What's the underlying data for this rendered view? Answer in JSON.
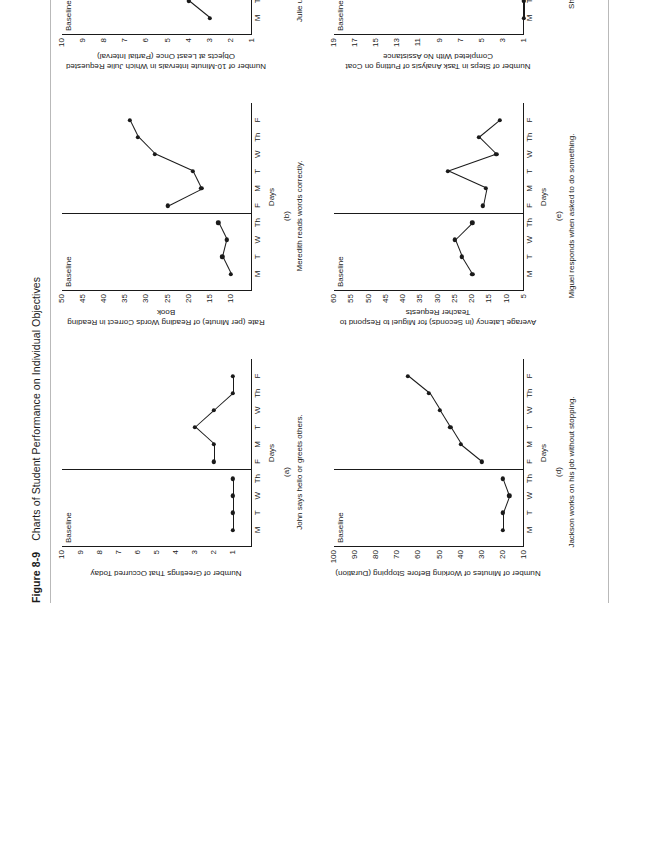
{
  "figure": {
    "number": "Figure 8-9",
    "title": "Charts of Student Performance on Individual Objectives",
    "folio": "193"
  },
  "common": {
    "baseline_label": "Baseline",
    "xaxis_title": "Days",
    "day_labels": [
      "M",
      "T",
      "W",
      "Th",
      "F",
      "M",
      "T",
      "W",
      "Th",
      "F"
    ]
  },
  "chart_data": [
    {
      "id": "a",
      "type": "line",
      "title": "Number of Greetings\nThat Occurred Today",
      "ylabel": "Number of Greetings That Occurred Today",
      "xlabel": "Days",
      "caption_letter": "(a)",
      "caption": "John says hello or greets others.",
      "phase_label": "Baseline",
      "phase_break_after": 3,
      "ylim": [
        0,
        10
      ],
      "yticks": [
        1,
        2,
        3,
        4,
        5,
        6,
        7,
        8,
        9,
        10
      ],
      "categories": [
        "M",
        "T",
        "W",
        "Th",
        "F",
        "M",
        "T",
        "W",
        "Th",
        "F"
      ],
      "values": [
        1,
        1,
        1,
        1,
        2,
        2,
        3,
        2,
        1,
        1
      ]
    },
    {
      "id": "b",
      "type": "line",
      "title": "Rate (per Minute) of Reading\nWords Correct in Reading Book",
      "ylabel": "Rate (per Minute) of Reading Words Correct in Reading Book",
      "xlabel": "Days",
      "caption_letter": "(b)",
      "caption": "Meredith reads words correctly.",
      "phase_label": "Baseline",
      "phase_break_after": 3,
      "ylim": [
        5,
        50
      ],
      "yticks": [
        10,
        15,
        20,
        25,
        30,
        35,
        40,
        45,
        50
      ],
      "categories": [
        "M",
        "T",
        "W",
        "Th",
        "F",
        "M",
        "T",
        "W",
        "Th",
        "F"
      ],
      "values": [
        10,
        12,
        11,
        13,
        25,
        17,
        19,
        28,
        32,
        34
      ]
    },
    {
      "id": "c",
      "type": "line",
      "title": "Number of 10-Minute Intervals\nin Which Julie Requested Objects\nat Least Once (Partial Interval)",
      "ylabel": "Number of 10-Minute Intervals in Which Julie Requested Objects at Least Once (Partial Interval)",
      "xlabel": "Days",
      "caption_letter": "(c)",
      "caption": "Julie uses words to ask for objects.",
      "phase_label": "Baseline",
      "phase_break_after": 3,
      "ylim": [
        1,
        10
      ],
      "yticks": [
        1,
        2,
        3,
        4,
        5,
        6,
        7,
        8,
        9,
        10
      ],
      "categories": [
        "M",
        "T",
        "W",
        "Th",
        "F",
        "M",
        "T",
        "W",
        "Th",
        "F"
      ],
      "values": [
        3,
        4,
        4,
        4,
        5,
        4,
        7,
        8,
        8,
        9
      ]
    },
    {
      "id": "d",
      "type": "line",
      "title": "Number of Minutes of Working\nBefore Stopping (Duration)",
      "ylabel": "Number of Minutes of Working Before Stopping (Duration)",
      "xlabel": "Days",
      "caption_letter": "(d)",
      "caption": "Jackson works on his job without stopping.",
      "phase_label": "Baseline",
      "phase_break_after": 3,
      "ylim": [
        10,
        100
      ],
      "yticks": [
        10,
        20,
        30,
        40,
        50,
        60,
        70,
        80,
        90,
        100
      ],
      "categories": [
        "M",
        "T",
        "W",
        "Th",
        "F",
        "M",
        "T",
        "W",
        "Th",
        "F"
      ],
      "values": [
        20,
        20,
        17,
        20,
        30,
        40,
        45,
        50,
        55,
        65
      ]
    },
    {
      "id": "e",
      "type": "line",
      "title": "Average Latency (in Seconds)\nfor Miguel to Respond to\nTeacher Requests",
      "ylabel": "Average Latency (in Seconds) for Miguel to Respond to Teacher Requests",
      "xlabel": "Days",
      "caption_letter": "(e)",
      "caption": "Miguel responds when asked to do something.",
      "phase_label": "Baseline",
      "phase_break_after": 3,
      "ylim": [
        5,
        60
      ],
      "yticks": [
        5,
        10,
        15,
        20,
        25,
        30,
        35,
        40,
        45,
        50,
        55,
        60
      ],
      "categories": [
        "M",
        "T",
        "W",
        "Th",
        "F",
        "M",
        "T",
        "W",
        "Th",
        "F"
      ],
      "values": [
        20,
        23,
        25,
        20,
        17,
        16,
        27,
        13,
        18,
        12
      ]
    },
    {
      "id": "f",
      "type": "line",
      "title": "Number of Steps in Task Analysis\nof Putting on Coat Completed\nWith No Assistance",
      "ylabel": "Number of Steps in Task Analysis of Putting on Coat Completed With No Assistance",
      "xlabel": "Days",
      "caption_letter": "(f)",
      "caption": "Shashona puts on her coat.",
      "phase_label": "Baseline",
      "phase_break_after": 3,
      "ylim": [
        1,
        19
      ],
      "yticks": [
        1,
        3,
        5,
        7,
        9,
        11,
        13,
        15,
        17,
        19
      ],
      "categories": [
        "M",
        "T",
        "W",
        "Th",
        "F",
        "M",
        "T",
        "W",
        "Th",
        "F"
      ],
      "values": [
        1,
        1,
        2,
        3,
        3,
        6,
        5,
        7,
        9,
        9
      ]
    }
  ]
}
